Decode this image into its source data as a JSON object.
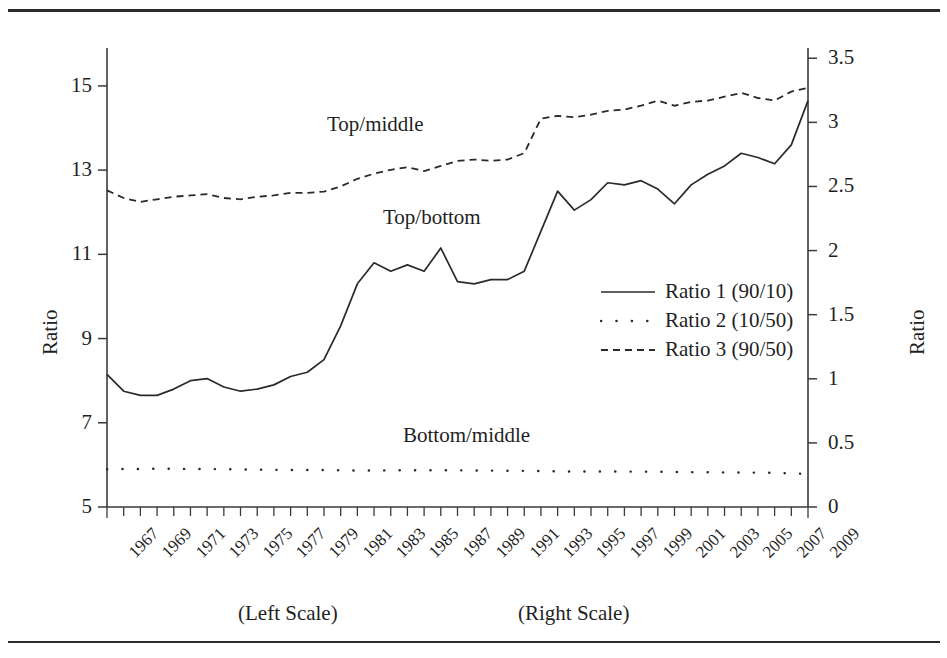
{
  "chart_data": {
    "type": "line",
    "title": "",
    "xlabel": "",
    "ylabel": "Ratio",
    "y2label": "Ratio",
    "grid": false,
    "legend_position": "center-right",
    "x": [
      1967,
      1968,
      1969,
      1970,
      1971,
      1972,
      1973,
      1974,
      1975,
      1976,
      1977,
      1978,
      1979,
      1980,
      1981,
      1982,
      1983,
      1984,
      1985,
      1986,
      1987,
      1988,
      1989,
      1990,
      1991,
      1992,
      1993,
      1994,
      1995,
      1996,
      1997,
      1998,
      1999,
      2000,
      2001,
      2002,
      2003,
      2004,
      2005,
      2006,
      2007,
      2008,
      2009
    ],
    "xtick_labels": [
      "1967",
      "1969",
      "1971",
      "1973",
      "1975",
      "1977",
      "1979",
      "1981",
      "1983",
      "1985",
      "1987",
      "1989",
      "1991",
      "1993",
      "1995",
      "1997",
      "1999",
      "2001",
      "2003",
      "2005",
      "2007",
      "2009"
    ],
    "ylim": [
      5,
      15.9
    ],
    "yticks": [
      5,
      7,
      9,
      11,
      13,
      15
    ],
    "ytick_labels": [
      "5",
      "7",
      "9",
      "11",
      "13",
      "15"
    ],
    "y2lim": [
      0,
      3.58
    ],
    "y2ticks": [
      0,
      0.5,
      1,
      1.5,
      2,
      2.5,
      3,
      3.5
    ],
    "y2tick_labels": [
      "0",
      "0.5",
      "1",
      "1.5",
      "2",
      "2.5",
      "3",
      "3.5"
    ],
    "series": [
      {
        "name": "Ratio 1 (90/10)",
        "annotation": "Top/bottom",
        "style": "solid",
        "axis": "left",
        "values": [
          8.15,
          7.75,
          7.65,
          7.65,
          7.8,
          8.0,
          8.05,
          7.85,
          7.75,
          7.8,
          7.9,
          8.1,
          8.2,
          8.5,
          9.3,
          10.3,
          10.8,
          10.6,
          10.75,
          10.6,
          11.15,
          10.35,
          10.3,
          10.4,
          10.4,
          10.6,
          11.55,
          12.5,
          12.05,
          12.3,
          12.7,
          12.65,
          12.75,
          12.55,
          12.2,
          12.65,
          12.9,
          13.1,
          13.4,
          13.3,
          13.15,
          13.6,
          14.65
        ]
      },
      {
        "name": "Ratio 2 (10/50)",
        "annotation": "Bottom/middle",
        "style": "dotted",
        "axis": "right",
        "values": [
          0.295,
          0.296,
          0.297,
          0.298,
          0.298,
          0.297,
          0.296,
          0.295,
          0.293,
          0.292,
          0.29,
          0.289,
          0.289,
          0.288,
          0.286,
          0.285,
          0.285,
          0.286,
          0.287,
          0.287,
          0.287,
          0.286,
          0.285,
          0.284,
          0.283,
          0.282,
          0.28,
          0.278,
          0.277,
          0.277,
          0.277,
          0.276,
          0.276,
          0.275,
          0.273,
          0.272,
          0.271,
          0.27,
          0.269,
          0.268,
          0.266,
          0.262,
          0.258
        ]
      },
      {
        "name": "Ratio 3 (90/50)",
        "annotation": "Top/middle",
        "style": "dashed",
        "axis": "right",
        "values": [
          2.47,
          2.41,
          2.38,
          2.4,
          2.42,
          2.43,
          2.44,
          2.41,
          2.4,
          2.42,
          2.43,
          2.45,
          2.45,
          2.46,
          2.5,
          2.56,
          2.6,
          2.63,
          2.65,
          2.62,
          2.66,
          2.7,
          2.71,
          2.7,
          2.71,
          2.76,
          3.03,
          3.05,
          3.04,
          3.06,
          3.09,
          3.1,
          3.13,
          3.17,
          3.13,
          3.16,
          3.17,
          3.2,
          3.23,
          3.19,
          3.17,
          3.24,
          3.27
        ]
      }
    ]
  },
  "axes": {
    "left_title": "Ratio",
    "right_title": "Ratio"
  },
  "legend": {
    "items": [
      {
        "label": "Ratio 1 (90/10)",
        "style": "solid"
      },
      {
        "label": "Ratio 2 (10/50)",
        "style": "dotted"
      },
      {
        "label": "Ratio 3 (90/50)",
        "style": "dashed"
      }
    ]
  },
  "annotations": {
    "top_middle": "Top/middle",
    "top_bottom": "Top/bottom",
    "bottom_middle": "Bottom/middle"
  },
  "scale_notes": {
    "left": "(Left Scale)",
    "right": "(Right Scale)"
  }
}
